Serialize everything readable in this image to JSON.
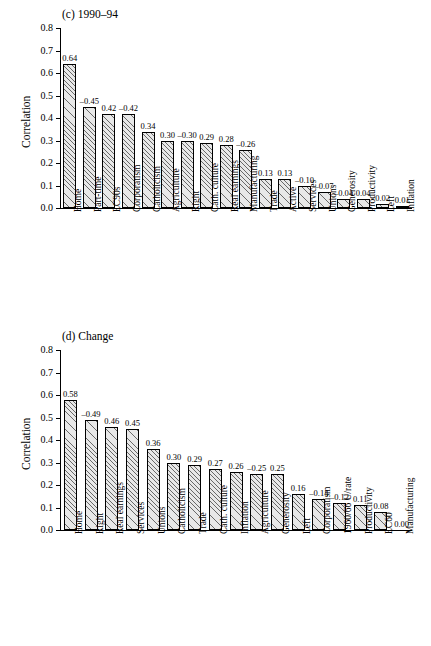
{
  "charts": [
    {
      "panel_id": "c",
      "title": "(c) 1990–94",
      "chart_data": {
        "type": "bar",
        "title": "(c) 1990–94",
        "xlabel": "",
        "ylabel": "Correlation",
        "ylim": [
          0,
          0.8
        ],
        "yticks": [
          "0.0",
          "0.1",
          "0.2",
          "0.3",
          "0.4",
          "0.5",
          "0.6",
          "0.7",
          "0.8"
        ],
        "grid": false,
        "legend": "none",
        "categories": [
          "Home",
          "Part-time",
          "EC90s",
          "Corporatism",
          "Catholicism",
          "Agriculture",
          "Right",
          "Cath. culture",
          "Real earnings",
          "Manufacturing",
          "Trade",
          "Active",
          "Services",
          "Unions",
          "Generosity",
          "Productivity",
          "Left",
          "Inflation"
        ],
        "values": [
          0.64,
          0.45,
          0.42,
          0.42,
          0.34,
          0.3,
          0.3,
          0.29,
          0.28,
          0.26,
          0.13,
          0.13,
          0.1,
          0.07,
          0.04,
          0.04,
          0.02,
          0.01
        ],
        "labels": [
          "0.64",
          "–0.45",
          "0.42",
          "–0.42",
          "0.34",
          "0.30",
          "–0.30",
          "0.29",
          "0.28",
          "–0.26",
          "0.13",
          "0.13",
          "–0.10",
          "–0.07",
          "–0.04",
          "0.04",
          "0.02",
          "0.01"
        ]
      }
    },
    {
      "panel_id": "d",
      "title": "(d) Change",
      "chart_data": {
        "type": "bar",
        "title": "(d) Change",
        "xlabel": "",
        "ylabel": "Correlation",
        "ylim": [
          0,
          0.8
        ],
        "yticks": [
          "0.0",
          "0.1",
          "0.2",
          "0.3",
          "0.4",
          "0.5",
          "0.6",
          "0.7",
          "0.8"
        ],
        "grid": false,
        "legend": "none",
        "categories": [
          "Home",
          "Right",
          "Real earnings",
          "Services",
          "Unions",
          "Catholicism",
          "Trade",
          "Cath. culture",
          "Inflation",
          "Agriculture",
          "Generosity",
          "Left",
          "Corporatism",
          "1960/66 U/rate",
          "Productivity",
          "EC60",
          "Manufacturing"
        ],
        "values": [
          0.58,
          0.49,
          0.46,
          0.45,
          0.36,
          0.3,
          0.29,
          0.27,
          0.26,
          0.25,
          0.25,
          0.16,
          0.14,
          0.12,
          0.11,
          0.08,
          0.0
        ],
        "labels": [
          "0.58",
          "–0.49",
          "0.46",
          "0.45",
          "0.36",
          "0.30",
          "0.29",
          "0.27",
          "0.26",
          "–0.25",
          "0.25",
          "0.16",
          "–0.14",
          "–0.12",
          "0.11",
          "0.08",
          "0.00"
        ]
      }
    }
  ]
}
